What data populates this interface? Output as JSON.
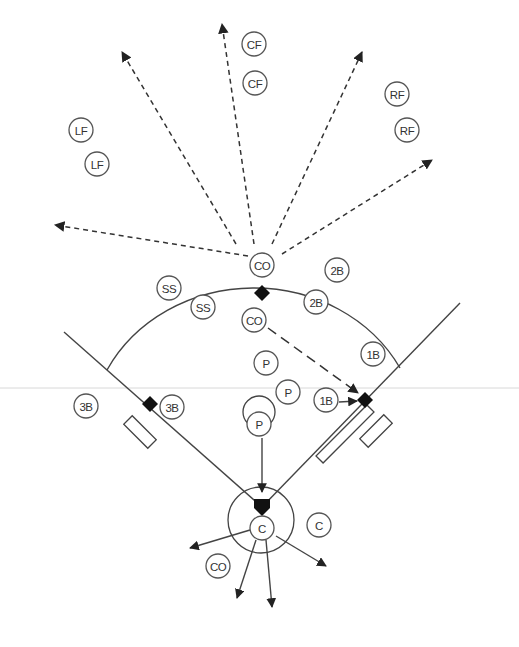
{
  "diagram": {
    "colors": {
      "line": "#444444",
      "base": "#111111",
      "background": "#ffffff",
      "guide": "#d8d8d8"
    },
    "players": [
      {
        "id": "lf1",
        "label": "LF",
        "x": 81,
        "y": 130
      },
      {
        "id": "lf2",
        "label": "LF",
        "x": 97,
        "y": 164
      },
      {
        "id": "cf1",
        "label": "CF",
        "x": 254,
        "y": 44
      },
      {
        "id": "cf2",
        "label": "CF",
        "x": 255,
        "y": 83
      },
      {
        "id": "rf1",
        "label": "RF",
        "x": 397,
        "y": 94
      },
      {
        "id": "rf2",
        "label": "RF",
        "x": 407,
        "y": 130
      },
      {
        "id": "co1",
        "label": "CO",
        "x": 262,
        "y": 265
      },
      {
        "id": "co2",
        "label": "CO",
        "x": 254,
        "y": 320
      },
      {
        "id": "ss1",
        "label": "SS",
        "x": 169,
        "y": 288
      },
      {
        "id": "ss2",
        "label": "SS",
        "x": 203,
        "y": 307
      },
      {
        "id": "2b1",
        "label": "2B",
        "x": 337,
        "y": 270
      },
      {
        "id": "2b2",
        "label": "2B",
        "x": 316,
        "y": 302
      },
      {
        "id": "1b1",
        "label": "1B",
        "x": 373,
        "y": 354
      },
      {
        "id": "1b2",
        "label": "1B",
        "x": 326,
        "y": 400
      },
      {
        "id": "3b1",
        "label": "3B",
        "x": 86,
        "y": 406
      },
      {
        "id": "3b2",
        "label": "3B",
        "x": 172,
        "y": 407
      },
      {
        "id": "p1",
        "label": "P",
        "x": 266,
        "y": 363
      },
      {
        "id": "p2",
        "label": "P",
        "x": 288,
        "y": 392
      },
      {
        "id": "p3",
        "label": "P",
        "x": 259,
        "y": 424
      },
      {
        "id": "c1",
        "label": "C",
        "x": 262,
        "y": 528
      },
      {
        "id": "c2",
        "label": "C",
        "x": 319,
        "y": 525
      },
      {
        "id": "co3",
        "label": "CO",
        "x": 218,
        "y": 566
      }
    ],
    "bases": [
      {
        "id": "second-base",
        "x": 262,
        "y": 293
      },
      {
        "id": "third-base",
        "x": 150,
        "y": 404
      },
      {
        "id": "first-base",
        "x": 365,
        "y": 400
      }
    ],
    "home_plate": {
      "x": 262,
      "y": 507
    },
    "fly_ball_arrows": [
      {
        "x1": 248,
        "y1": 256,
        "x2": 55,
        "y2": 225
      },
      {
        "x1": 236,
        "y1": 244,
        "x2": 122,
        "y2": 52
      },
      {
        "x1": 254,
        "y1": 244,
        "x2": 222,
        "y2": 24
      },
      {
        "x1": 272,
        "y1": 244,
        "x2": 362,
        "y2": 52
      },
      {
        "x1": 282,
        "y1": 254,
        "x2": 432,
        "y2": 160
      }
    ],
    "throw_arrows": [
      {
        "x1": 262,
        "y1": 438,
        "x2": 262,
        "y2": 492,
        "style": "solid"
      },
      {
        "x1": 339,
        "y1": 402,
        "x2": 357,
        "y2": 401,
        "style": "solid"
      },
      {
        "x1": 268,
        "y1": 328,
        "x2": 358,
        "y2": 393,
        "style": "longdash"
      },
      {
        "x1": 250,
        "y1": 530,
        "x2": 190,
        "y2": 548,
        "style": "solid"
      },
      {
        "x1": 256,
        "y1": 540,
        "x2": 237,
        "y2": 598,
        "style": "solid"
      },
      {
        "x1": 266,
        "y1": 540,
        "x2": 272,
        "y2": 607,
        "style": "solid"
      },
      {
        "x1": 276,
        "y1": 536,
        "x2": 326,
        "y2": 566,
        "style": "solid"
      }
    ]
  }
}
